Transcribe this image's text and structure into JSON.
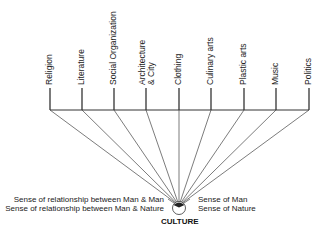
{
  "diagram": {
    "title": "CULTURE",
    "categories": [
      {
        "label": "Religion",
        "x": 50
      },
      {
        "label": "Literature",
        "x": 82
      },
      {
        "label": "Social Organization",
        "x": 114
      },
      {
        "label": "Architecture",
        "label2": "& City",
        "x": 146
      },
      {
        "label": "Clothing",
        "x": 179
      },
      {
        "label": "Culinary arts",
        "x": 211
      },
      {
        "label": "Plastic arts",
        "x": 244
      },
      {
        "label": "Music",
        "x": 276
      },
      {
        "label": "Politics",
        "x": 309
      }
    ],
    "left_labels": [
      "Sense of relationship between Man & Man",
      "Sense of relationship between Man & Nature"
    ],
    "right_labels": [
      "Sense of Man",
      "Sense of Nature"
    ],
    "colors": {
      "line": "#333333",
      "text": "#222222"
    }
  }
}
